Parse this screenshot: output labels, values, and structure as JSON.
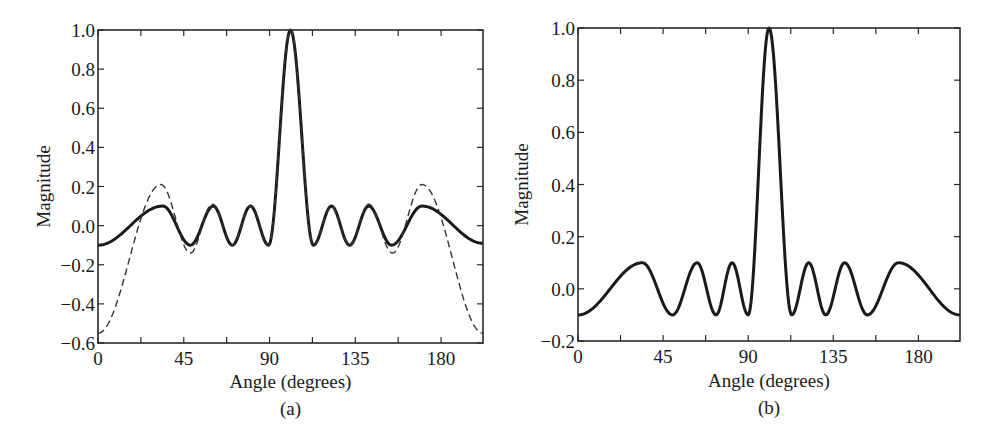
{
  "chart_data": [
    {
      "id": "a",
      "type": "line",
      "caption": "(a)",
      "title": "",
      "xlabel": "Angle (degrees)",
      "ylabel": "Magnitude",
      "xlim": [
        0,
        202
      ],
      "ylim": [
        -0.6,
        1.0
      ],
      "xticks": [
        0,
        45,
        90,
        135,
        180
      ],
      "xticks_minor": [
        22.5,
        67.5,
        112.5,
        157.5
      ],
      "yticks": [
        -0.6,
        -0.4,
        -0.2,
        0.0,
        0.2,
        0.4,
        0.6,
        0.8,
        1.0
      ],
      "ytick_labels": [
        "−0.6",
        "−0.4",
        "−0.2",
        "0.0",
        "0.2",
        "0.4",
        "0.6",
        "0.8",
        "1.0"
      ],
      "grid": false,
      "legend": null,
      "series": [
        {
          "name": "solid",
          "style": "solid",
          "color": "#1a1a1a",
          "extrema": [
            [
              0,
              -0.1
            ],
            [
              34,
              0.1
            ],
            [
              48.5,
              -0.1
            ],
            [
              60.5,
              0.1
            ],
            [
              70.5,
              -0.1
            ],
            [
              80,
              0.1
            ],
            [
              89.5,
              -0.1
            ],
            [
              101,
              1.0
            ],
            [
              113,
              -0.1
            ],
            [
              122.5,
              0.1
            ],
            [
              132,
              -0.1
            ],
            [
              142,
              0.1
            ],
            [
              154,
              -0.1
            ],
            [
              170,
              0.1
            ],
            [
              202,
              -0.09
            ]
          ]
        },
        {
          "name": "dashed",
          "style": "dashed",
          "color": "#333333",
          "extrema": [
            [
              0,
              -0.55
            ],
            [
              33,
              0.21
            ],
            [
              48.5,
              -0.14
            ],
            [
              60,
              0.11
            ],
            [
              70.5,
              -0.1
            ],
            [
              80,
              0.1
            ],
            [
              89.5,
              -0.1
            ],
            [
              101,
              1.0
            ],
            [
              113,
              -0.1
            ],
            [
              122.5,
              0.1
            ],
            [
              132,
              -0.1
            ],
            [
              142,
              0.11
            ],
            [
              154.5,
              -0.14
            ],
            [
              170,
              0.21
            ],
            [
              202,
              -0.55
            ]
          ]
        }
      ]
    },
    {
      "id": "b",
      "type": "line",
      "caption": "(b)",
      "title": "",
      "xlabel": "Angle (degrees)",
      "ylabel": "Magnitude",
      "xlim": [
        0,
        202
      ],
      "ylim": [
        -0.2,
        1.0
      ],
      "xticks": [
        0,
        45,
        90,
        135,
        180
      ],
      "xticks_minor": [
        22.5,
        67.5,
        112.5,
        157.5
      ],
      "yticks": [
        -0.2,
        0.0,
        0.2,
        0.4,
        0.6,
        0.8,
        1.0
      ],
      "ytick_labels": [
        "−0.2",
        "0.0",
        "0.2",
        "0.4",
        "0.6",
        "0.8",
        "1.0"
      ],
      "grid": false,
      "legend": null,
      "series": [
        {
          "name": "solid",
          "style": "solid",
          "color": "#1a1a1a",
          "extrema": [
            [
              0,
              -0.1
            ],
            [
              34,
              0.1
            ],
            [
              50,
              -0.1
            ],
            [
              63,
              0.1
            ],
            [
              73,
              -0.1
            ],
            [
              81.5,
              0.1
            ],
            [
              90,
              -0.1
            ],
            [
              101,
              1.0
            ],
            [
              113,
              -0.1
            ],
            [
              122,
              0.1
            ],
            [
              131,
              -0.1
            ],
            [
              141,
              0.1
            ],
            [
              153,
              -0.1
            ],
            [
              169.5,
              0.1
            ],
            [
              202,
              -0.1
            ]
          ]
        }
      ]
    }
  ],
  "layout": {
    "panels": [
      {
        "left": 98,
        "top": 30,
        "right": 483,
        "bottom": 343,
        "caption_y": 415,
        "xlabel_y": 388,
        "ylabel_x": 50
      },
      {
        "left": 578,
        "top": 28,
        "right": 960,
        "bottom": 341,
        "caption_y": 414,
        "xlabel_y": 387,
        "ylabel_x": 528
      }
    ]
  }
}
